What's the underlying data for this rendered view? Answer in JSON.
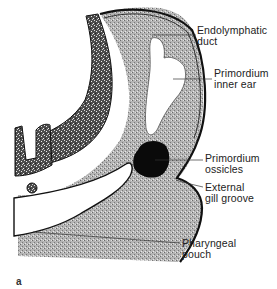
{
  "figure": {
    "panel_letter": "a",
    "labels": [
      {
        "id": "endolymphatic-duct",
        "line1": "Endolymphatic",
        "line2": "duct"
      },
      {
        "id": "primordium-inner-ear",
        "line1": "Primordium",
        "line2": "inner ear"
      },
      {
        "id": "primordium-ossicles",
        "line1": "Primordium",
        "line2": "ossicles"
      },
      {
        "id": "external-gill-groove",
        "line1": "External",
        "line2": "gill groove"
      },
      {
        "id": "pharyngeal-pouch",
        "line1": "Pharyngeal",
        "line2": "pouch"
      }
    ],
    "colors": {
      "background": "#ffffff",
      "mesenchyme": "#a8a8a8",
      "neural_tube": "#6a6a6a",
      "ossicles": "#0a0a0a",
      "outline": "#111111",
      "leader_line": "#333333"
    }
  }
}
